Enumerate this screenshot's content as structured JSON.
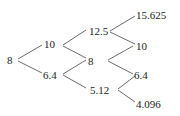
{
  "diagram": {
    "type": "binomial-tree",
    "levels": [
      [
        "8"
      ],
      [
        "10",
        "6.4"
      ],
      [
        "12.5",
        "8",
        "5.12"
      ],
      [
        "15.625",
        "10",
        "6.4",
        "4.096"
      ]
    ],
    "nodes": {
      "n0": "8",
      "n1u": "10",
      "n1d": "6.4",
      "n2uu": "12.5",
      "n2ud": "8",
      "n2dd": "5.12",
      "n3uuu": "15.625",
      "n3uud": "10",
      "n3udd": "6.4",
      "n3ddd": "4.096"
    },
    "colors": {
      "text": "#222222",
      "lines": "#444444",
      "background": "#ffffff"
    }
  }
}
